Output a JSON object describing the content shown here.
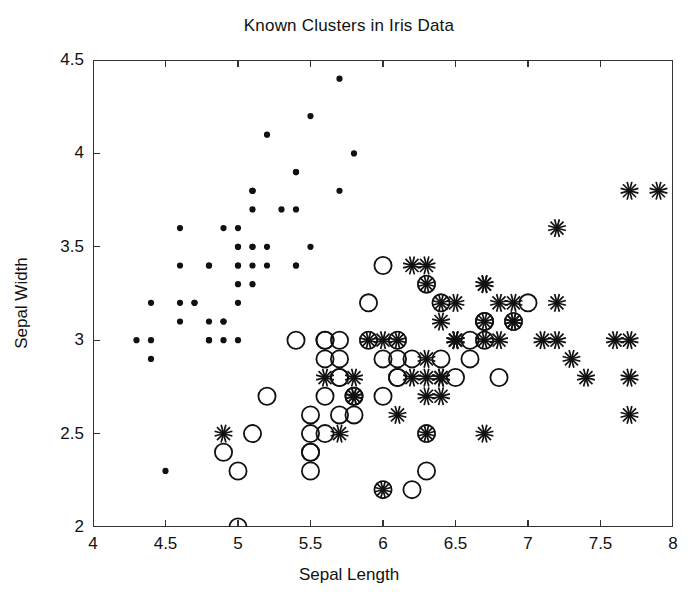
{
  "chart_data": {
    "type": "scatter",
    "title": "Known Clusters in Iris Data",
    "xlabel": "Sepal Length",
    "ylabel": "Sepal Width",
    "xlim": [
      4,
      8
    ],
    "ylim": [
      2,
      4.5
    ],
    "xticks": [
      4,
      4.5,
      5,
      5.5,
      6,
      6.5,
      7,
      7.5,
      8
    ],
    "xtick_labels": [
      "4",
      "4.5",
      "5",
      "5.5",
      "6",
      "6.5",
      "7",
      "7.5",
      "8"
    ],
    "yticks": [
      2,
      2.5,
      3,
      3.5,
      4,
      4.5
    ],
    "ytick_labels": [
      "2",
      "2.5",
      "3",
      "3.5",
      "4",
      "4.5"
    ],
    "grid": false,
    "legend": "none",
    "marker_color": "#111111",
    "series": [
      {
        "name": "cluster-1",
        "marker": "dot",
        "points": [
          [
            5.1,
            3.5
          ],
          [
            4.9,
            3.0
          ],
          [
            4.7,
            3.2
          ],
          [
            4.6,
            3.1
          ],
          [
            5.0,
            3.6
          ],
          [
            5.4,
            3.9
          ],
          [
            4.6,
            3.4
          ],
          [
            5.0,
            3.4
          ],
          [
            4.4,
            2.9
          ],
          [
            4.9,
            3.1
          ],
          [
            5.4,
            3.7
          ],
          [
            4.8,
            3.4
          ],
          [
            4.8,
            3.0
          ],
          [
            4.3,
            3.0
          ],
          [
            5.8,
            4.0
          ],
          [
            5.7,
            4.4
          ],
          [
            5.4,
            3.9
          ],
          [
            5.1,
            3.5
          ],
          [
            5.7,
            3.8
          ],
          [
            5.1,
            3.8
          ],
          [
            5.4,
            3.4
          ],
          [
            5.1,
            3.7
          ],
          [
            4.6,
            3.6
          ],
          [
            5.1,
            3.3
          ],
          [
            4.8,
            3.4
          ],
          [
            5.0,
            3.0
          ],
          [
            5.0,
            3.4
          ],
          [
            5.2,
            3.5
          ],
          [
            5.2,
            3.4
          ],
          [
            4.7,
            3.2
          ],
          [
            4.8,
            3.1
          ],
          [
            5.4,
            3.4
          ],
          [
            5.2,
            4.1
          ],
          [
            5.5,
            4.2
          ],
          [
            4.9,
            3.1
          ],
          [
            5.0,
            3.2
          ],
          [
            5.5,
            3.5
          ],
          [
            4.9,
            3.6
          ],
          [
            4.4,
            3.0
          ],
          [
            5.1,
            3.4
          ],
          [
            5.0,
            3.5
          ],
          [
            4.5,
            2.3
          ],
          [
            4.4,
            3.2
          ],
          [
            5.0,
            3.5
          ],
          [
            5.1,
            3.8
          ],
          [
            4.8,
            3.0
          ],
          [
            5.1,
            3.8
          ],
          [
            4.6,
            3.2
          ],
          [
            5.3,
            3.7
          ],
          [
            5.0,
            3.3
          ]
        ]
      },
      {
        "name": "cluster-2",
        "marker": "circle",
        "points": [
          [
            7.0,
            3.2
          ],
          [
            6.4,
            3.2
          ],
          [
            6.9,
            3.1
          ],
          [
            5.5,
            2.3
          ],
          [
            6.5,
            2.8
          ],
          [
            5.7,
            2.8
          ],
          [
            6.3,
            3.3
          ],
          [
            4.9,
            2.4
          ],
          [
            6.6,
            2.9
          ],
          [
            5.2,
            2.7
          ],
          [
            5.0,
            2.0
          ],
          [
            5.9,
            3.0
          ],
          [
            6.0,
            2.2
          ],
          [
            6.1,
            2.9
          ],
          [
            5.6,
            2.9
          ],
          [
            6.7,
            3.1
          ],
          [
            5.6,
            3.0
          ],
          [
            5.8,
            2.7
          ],
          [
            6.2,
            2.2
          ],
          [
            5.6,
            2.5
          ],
          [
            5.9,
            3.2
          ],
          [
            6.1,
            2.8
          ],
          [
            6.3,
            2.5
          ],
          [
            6.1,
            2.8
          ],
          [
            6.4,
            2.9
          ],
          [
            6.6,
            3.0
          ],
          [
            6.8,
            2.8
          ],
          [
            6.7,
            3.0
          ],
          [
            6.0,
            2.9
          ],
          [
            5.7,
            2.6
          ],
          [
            5.5,
            2.4
          ],
          [
            5.5,
            2.4
          ],
          [
            5.8,
            2.7
          ],
          [
            6.0,
            2.7
          ],
          [
            5.4,
            3.0
          ],
          [
            6.0,
            3.4
          ],
          [
            6.7,
            3.1
          ],
          [
            6.3,
            2.3
          ],
          [
            5.6,
            3.0
          ],
          [
            5.5,
            2.5
          ],
          [
            5.5,
            2.6
          ],
          [
            6.1,
            3.0
          ],
          [
            5.8,
            2.6
          ],
          [
            5.0,
            2.3
          ],
          [
            5.6,
            2.7
          ],
          [
            5.7,
            3.0
          ],
          [
            5.7,
            2.9
          ],
          [
            6.2,
            2.9
          ],
          [
            5.1,
            2.5
          ],
          [
            5.7,
            2.8
          ]
        ]
      },
      {
        "name": "cluster-3",
        "marker": "asterisk",
        "points": [
          [
            6.3,
            3.3
          ],
          [
            5.8,
            2.7
          ],
          [
            7.1,
            3.0
          ],
          [
            6.3,
            2.9
          ],
          [
            6.5,
            3.0
          ],
          [
            7.6,
            3.0
          ],
          [
            4.9,
            2.5
          ],
          [
            7.3,
            2.9
          ],
          [
            6.7,
            2.5
          ],
          [
            7.2,
            3.6
          ],
          [
            6.5,
            3.2
          ],
          [
            6.4,
            2.7
          ],
          [
            6.8,
            3.0
          ],
          [
            5.7,
            2.5
          ],
          [
            5.8,
            2.8
          ],
          [
            6.4,
            3.2
          ],
          [
            6.5,
            3.0
          ],
          [
            7.7,
            3.8
          ],
          [
            7.7,
            2.6
          ],
          [
            6.0,
            2.2
          ],
          [
            6.9,
            3.2
          ],
          [
            5.6,
            2.8
          ],
          [
            7.7,
            2.8
          ],
          [
            6.3,
            2.7
          ],
          [
            6.7,
            3.3
          ],
          [
            7.2,
            3.2
          ],
          [
            6.2,
            2.8
          ],
          [
            6.1,
            3.0
          ],
          [
            6.4,
            2.8
          ],
          [
            7.2,
            3.0
          ],
          [
            7.4,
            2.8
          ],
          [
            7.9,
            3.8
          ],
          [
            6.4,
            2.8
          ],
          [
            6.3,
            2.8
          ],
          [
            6.1,
            2.6
          ],
          [
            7.7,
            3.0
          ],
          [
            6.3,
            3.4
          ],
          [
            6.4,
            3.1
          ],
          [
            6.0,
            3.0
          ],
          [
            6.9,
            3.1
          ],
          [
            6.7,
            3.1
          ],
          [
            6.9,
            3.1
          ],
          [
            5.8,
            2.7
          ],
          [
            6.8,
            3.2
          ],
          [
            6.7,
            3.3
          ],
          [
            6.7,
            3.0
          ],
          [
            6.3,
            2.5
          ],
          [
            6.5,
            3.0
          ],
          [
            6.2,
            3.4
          ],
          [
            5.9,
            3.0
          ]
        ]
      }
    ]
  }
}
